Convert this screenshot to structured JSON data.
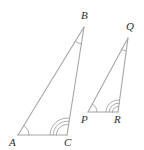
{
  "figure": {
    "stroke_color": "#a6a6a6",
    "label_color": "#2e2e2e",
    "stroke_width": 1.1,
    "background": "#ffffff",
    "width": 144,
    "height": 150
  },
  "triangles": [
    {
      "name": "triangle-abc",
      "vertices": [
        {
          "label": "A",
          "x": 18,
          "y": 135,
          "label_x": 9,
          "label_y": 137,
          "arc_count": 1,
          "arc_radius": 11
        },
        {
          "label": "B",
          "x": 84,
          "y": 27,
          "label_x": 81,
          "label_y": 10,
          "arc_count": 1,
          "arc_radius": 17
        },
        {
          "label": "C",
          "x": 67,
          "y": 135,
          "label_x": 64,
          "label_y": 137,
          "arc_count": 3,
          "arc_radius": 17
        }
      ]
    },
    {
      "name": "triangle-pqr",
      "vertices": [
        {
          "label": "P",
          "x": 88,
          "y": 112,
          "label_x": 81,
          "label_y": 114,
          "arc_count": 1,
          "arc_radius": 9
        },
        {
          "label": "Q",
          "x": 128,
          "y": 38,
          "label_x": 126,
          "label_y": 21,
          "arc_count": 1,
          "arc_radius": 13
        },
        {
          "label": "R",
          "x": 118,
          "y": 112,
          "label_x": 114,
          "label_y": 114,
          "arc_count": 3,
          "arc_radius": 12
        }
      ]
    }
  ]
}
